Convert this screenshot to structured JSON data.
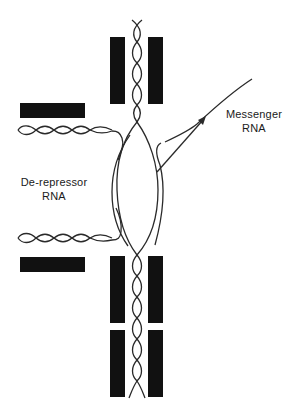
{
  "diagram": {
    "title": "",
    "labels": {
      "messenger_rna": {
        "line1": "Messenger",
        "line2": "RNA"
      },
      "derepressor_rna": {
        "line1": "De-repressor",
        "line2": "RNA"
      }
    },
    "colors": {
      "bars": "#111111",
      "strands": "#2a2a2a",
      "background": "#ffffff",
      "text": "#1a1a1a"
    },
    "components": [
      "central DNA double helix",
      "opened DNA bubble with transcripts",
      "paired protein blocks (upper)",
      "paired protein blocks (lower, two levels)",
      "horizontal repressor blocks (left)",
      "de-repressor RNA helices (left, two)",
      "messenger RNA strand with arrow"
    ]
  }
}
